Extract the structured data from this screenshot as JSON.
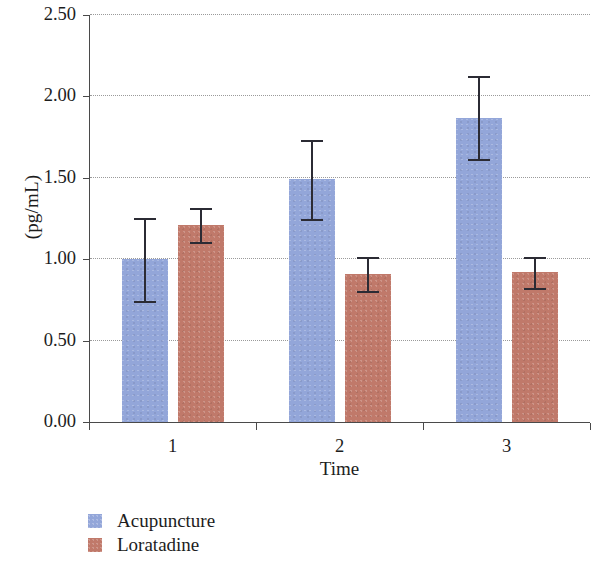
{
  "chart_data": {
    "type": "bar",
    "title": "",
    "subtitle": "",
    "xlabel": "Time",
    "ylabel": "(pg/mL)",
    "categories": [
      "1",
      "2",
      "3"
    ],
    "series": [
      {
        "name": "Acupuncture",
        "color": "#93a6d9",
        "values": [
          1.0,
          1.49,
          1.87
        ],
        "errors": [
          0.26,
          0.25,
          0.26
        ]
      },
      {
        "name": "Loratadine",
        "color": "#c0796a",
        "values": [
          1.21,
          0.91,
          0.92
        ],
        "errors": [
          0.11,
          0.11,
          0.1
        ]
      }
    ],
    "ylim": [
      0.0,
      2.5
    ],
    "ytick_labels": [
      "0.00",
      "0.50",
      "1.00",
      "1.50",
      "2.00",
      "2.50"
    ],
    "ytick_values": [
      0.0,
      0.5,
      1.0,
      1.5,
      2.0,
      2.5
    ],
    "xtick_labels": [
      "1",
      "2",
      "3"
    ],
    "grid": "horizontal-dotted",
    "legend_position": "bottom-left",
    "error_bar_style": "capped-vertical",
    "error_bar_color": "#2b2b34",
    "axis_color": "#4a4a4a",
    "gridline_color": "#9a9a9a",
    "background": "#ffffff"
  }
}
